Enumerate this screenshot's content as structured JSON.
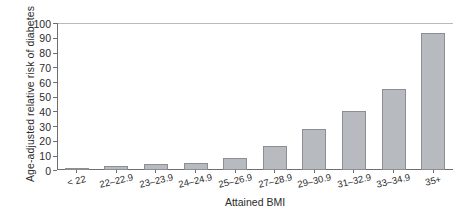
{
  "chart_data": {
    "type": "bar",
    "title": "",
    "xlabel": "Attained BMI",
    "ylabel": "Age-adjusted relative risk of diabetes",
    "categories": [
      "< 22",
      "22–22.9",
      "23–23.9",
      "24–24.9",
      "25–26.9",
      "27–28.9",
      "29–30.9",
      "31–32.9",
      "33–34.9",
      "35+"
    ],
    "values": [
      1,
      3,
      4,
      5,
      8,
      16,
      28,
      40,
      55,
      93
    ],
    "ylim": [
      0,
      100
    ],
    "ytick_labels": [
      "100",
      "90",
      "80",
      "70",
      "60",
      "50",
      "40",
      "30",
      "20",
      "10",
      "0"
    ],
    "ytick_values": [
      100,
      90,
      80,
      70,
      60,
      50,
      40,
      30,
      20,
      10,
      0
    ],
    "grid": false,
    "legend": null,
    "bar_fill_color": "#b7bbbf",
    "bar_border_color": "#8b8f93",
    "axis_color": "#6e6e6e"
  }
}
